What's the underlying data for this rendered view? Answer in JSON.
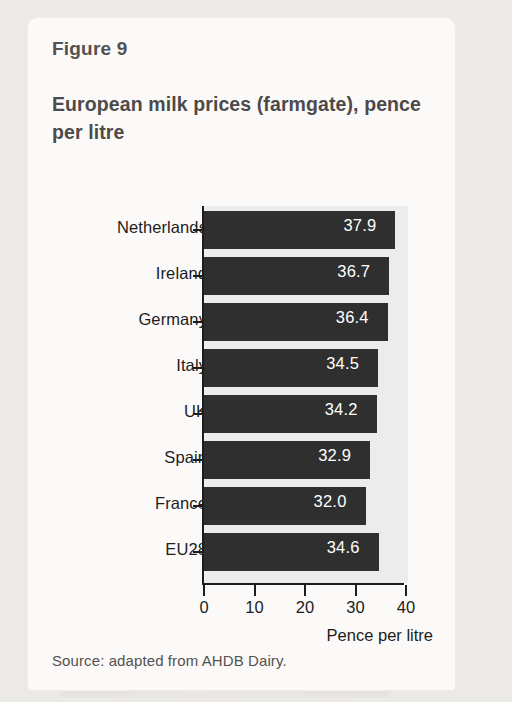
{
  "figure": {
    "number_label": "Figure 9",
    "title": "European milk prices (farmgate), pence per litre",
    "source": "Source: adapted from AHDB Dairy."
  },
  "colors": {
    "bar": "#2f2f2f",
    "panel": "#ececec",
    "card": "#fbfaf9",
    "page": "#eceae7",
    "axis": "#1d1d1d",
    "title_text": "#4d4a49",
    "value_label": "#ffffff"
  },
  "chart_data": {
    "type": "bar",
    "orientation": "horizontal",
    "title": "European milk prices (farmgate), pence per litre",
    "xlabel": "Pence per litre",
    "ylabel": "",
    "xlim": [
      0,
      40
    ],
    "xticks": [
      "0",
      "10",
      "20",
      "30",
      "40"
    ],
    "xtick_values": [
      0,
      10,
      20,
      30,
      40
    ],
    "grid": false,
    "legend": "none",
    "categories": [
      "Netherlands",
      "Ireland",
      "Germany",
      "Italy",
      "UK",
      "Spain",
      "France",
      "EU28"
    ],
    "values": [
      37.9,
      36.7,
      36.4,
      34.5,
      34.2,
      32.9,
      32.0,
      34.6
    ],
    "value_labels": [
      "37.9",
      "36.7",
      "36.4",
      "34.5",
      "34.2",
      "32.9",
      "32.0",
      "34.6"
    ],
    "bars": [
      {
        "category": "Netherlands",
        "value": 37.9,
        "label": "37.9"
      },
      {
        "category": "Ireland",
        "value": 36.7,
        "label": "36.7"
      },
      {
        "category": "Germany",
        "value": 36.4,
        "label": "36.4"
      },
      {
        "category": "Italy",
        "value": 34.5,
        "label": "34.5"
      },
      {
        "category": "UK",
        "value": 34.2,
        "label": "34.2"
      },
      {
        "category": "Spain",
        "value": 32.9,
        "label": "32.9"
      },
      {
        "category": "France",
        "value": 32.0,
        "label": "32.0"
      },
      {
        "category": "EU28",
        "value": 34.6,
        "label": "34.6"
      }
    ]
  }
}
